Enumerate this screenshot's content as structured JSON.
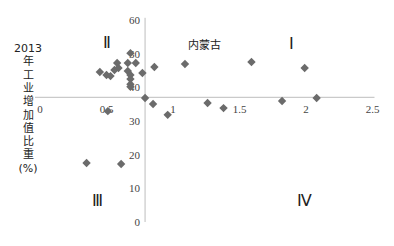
{
  "chart_data": {
    "type": "scatter",
    "title": "",
    "xlabel": "",
    "ylabel": "2013年工业增加值比重(%)",
    "ylabel_lines": [
      "2013",
      "年",
      "工",
      "业",
      "增",
      "加",
      "值",
      "比",
      "重",
      "(%)"
    ],
    "xlim": [
      0,
      2.5
    ],
    "ylim": [
      0,
      60
    ],
    "x_ticks": [
      "0",
      "0.5",
      "1",
      "1.5",
      "2",
      "2.5"
    ],
    "y_ticks": [
      "0",
      "10",
      "20",
      "30",
      "40",
      "50",
      "60"
    ],
    "axis_cross": {
      "x": 0.79,
      "y": 37
    },
    "grid": false,
    "marker": "diamond",
    "marker_color": "#6b6b6b",
    "annotations": [
      {
        "text": "内蒙古",
        "x": 1.24,
        "y": 51.3,
        "kind": "label"
      },
      {
        "text": "Ⅰ",
        "x": 1.89,
        "y": 51.3,
        "kind": "quadrant"
      },
      {
        "text": "Ⅱ",
        "x": 0.5,
        "y": 51.7,
        "kind": "quadrant"
      },
      {
        "text": "Ⅲ",
        "x": 0.43,
        "y": 4.7,
        "kind": "quadrant"
      },
      {
        "text": "Ⅳ",
        "x": 1.99,
        "y": 4.8,
        "kind": "quadrant"
      }
    ],
    "points": [
      {
        "x": 0.45,
        "y": 44.5
      },
      {
        "x": 0.5,
        "y": 43.6
      },
      {
        "x": 0.53,
        "y": 43.3
      },
      {
        "x": 0.56,
        "y": 45.1
      },
      {
        "x": 0.58,
        "y": 47.2
      },
      {
        "x": 0.59,
        "y": 45.7
      },
      {
        "x": 0.66,
        "y": 47.2
      },
      {
        "x": 0.72,
        "y": 47.2
      },
      {
        "x": 0.66,
        "y": 44.8
      },
      {
        "x": 0.68,
        "y": 43.6
      },
      {
        "x": 0.68,
        "y": 42.4
      },
      {
        "x": 0.68,
        "y": 40.9
      },
      {
        "x": 0.68,
        "y": 40.1
      },
      {
        "x": 0.68,
        "y": 50.1
      },
      {
        "x": 0.77,
        "y": 44.2
      },
      {
        "x": 0.86,
        "y": 46.0
      },
      {
        "x": 1.09,
        "y": 46.9
      },
      {
        "x": 1.59,
        "y": 47.5
      },
      {
        "x": 1.99,
        "y": 45.7
      },
      {
        "x": 0.79,
        "y": 36.8
      },
      {
        "x": 0.85,
        "y": 35.0
      },
      {
        "x": 0.96,
        "y": 31.8
      },
      {
        "x": 1.26,
        "y": 35.3
      },
      {
        "x": 1.38,
        "y": 33.8
      },
      {
        "x": 1.82,
        "y": 35.9
      },
      {
        "x": 2.08,
        "y": 36.8
      },
      {
        "x": 0.35,
        "y": 17.5
      },
      {
        "x": 0.61,
        "y": 17.2
      },
      {
        "x": 0.51,
        "y": 32.9
      }
    ]
  }
}
